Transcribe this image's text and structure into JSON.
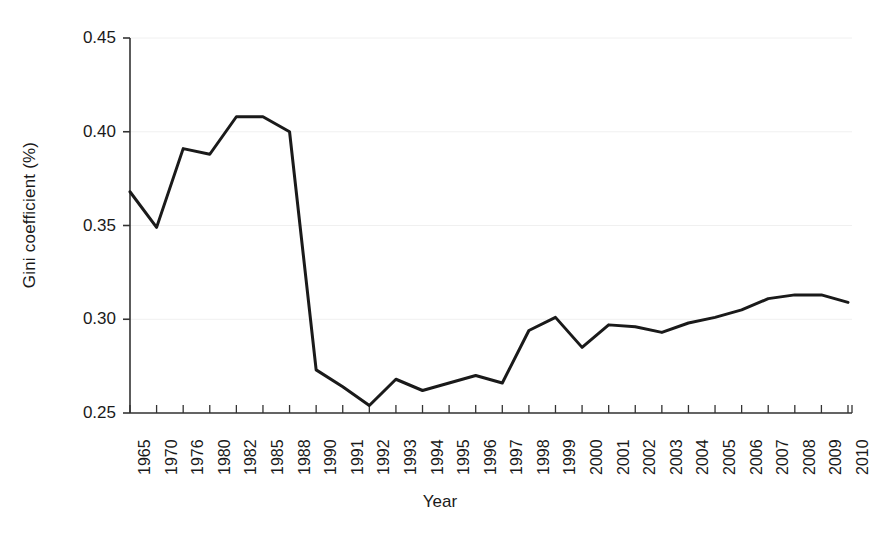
{
  "chart_data": {
    "type": "line",
    "title": "",
    "subtitle": "",
    "xlabel": "Year",
    "ylabel": "Gini coefficient (%)",
    "legend": [],
    "legend_position": "none",
    "grid": true,
    "ylim": [
      0.25,
      0.45
    ],
    "yticks": [
      "0.25",
      "0.30",
      "0.35",
      "0.40",
      "0.45"
    ],
    "ytick_values": [
      0.25,
      0.3,
      0.35,
      0.4,
      0.45
    ],
    "categories": [
      "1965",
      "1970",
      "1976",
      "1980",
      "1982",
      "1985",
      "1988",
      "1990",
      "1991",
      "1992",
      "1993",
      "1994",
      "1995",
      "1996",
      "1997",
      "1998",
      "1999",
      "2000",
      "2001",
      "2002",
      "2003",
      "2004",
      "2005",
      "2006",
      "2007",
      "2008",
      "2009",
      "2010"
    ],
    "values": [
      0.368,
      0.349,
      0.391,
      0.388,
      0.408,
      0.408,
      0.4,
      0.273,
      0.264,
      0.254,
      0.268,
      0.262,
      0.266,
      0.27,
      0.266,
      0.294,
      0.301,
      0.285,
      0.297,
      0.296,
      0.293,
      0.298,
      0.301,
      0.305,
      0.311,
      0.313,
      0.313,
      0.309
    ],
    "series": [
      {
        "name": "Gini coefficient",
        "color": "#1a1a1a",
        "values": [
          0.368,
          0.349,
          0.391,
          0.388,
          0.408,
          0.408,
          0.4,
          0.273,
          0.264,
          0.254,
          0.268,
          0.262,
          0.266,
          0.27,
          0.266,
          0.294,
          0.301,
          0.285,
          0.297,
          0.296,
          0.293,
          0.298,
          0.301,
          0.305,
          0.311,
          0.313,
          0.313,
          0.309
        ]
      }
    ],
    "line_color": "#1a1a1a",
    "line_width": 3,
    "axis_color": "#333333",
    "grid_color": "#f0f0f0",
    "background": "#ffffff"
  }
}
